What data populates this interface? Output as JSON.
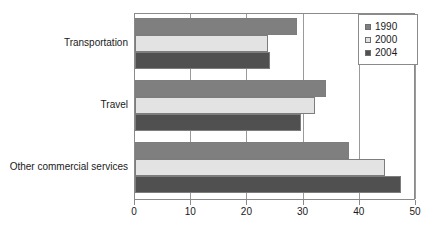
{
  "chart_data": {
    "type": "bar",
    "orientation": "horizontal",
    "title": "",
    "xlabel": "",
    "ylabel": "",
    "xlim": [
      0,
      50
    ],
    "xticks": [
      0,
      10,
      20,
      30,
      40,
      50
    ],
    "grid": true,
    "legend_position": "top-right",
    "categories": [
      "Transportation",
      "Travel",
      "Other commercial services"
    ],
    "series": [
      {
        "name": "1990",
        "color": "#7f7f7f",
        "values": [
          28.8,
          34.0,
          38.0
        ]
      },
      {
        "name": "2000",
        "color": "#e3e3e3",
        "values": [
          23.7,
          32.0,
          44.5
        ]
      },
      {
        "name": "2004",
        "color": "#505050",
        "values": [
          24.0,
          29.5,
          47.3
        ]
      }
    ]
  },
  "axis": {
    "tick_labels": [
      "0",
      "10",
      "20",
      "30",
      "40",
      "50"
    ]
  },
  "legend": {
    "entries": [
      {
        "label": "1990"
      },
      {
        "label": "2000"
      },
      {
        "label": "2004"
      }
    ]
  },
  "categories": {
    "labels": [
      "Transportation",
      "Travel",
      "Other commercial services"
    ]
  }
}
